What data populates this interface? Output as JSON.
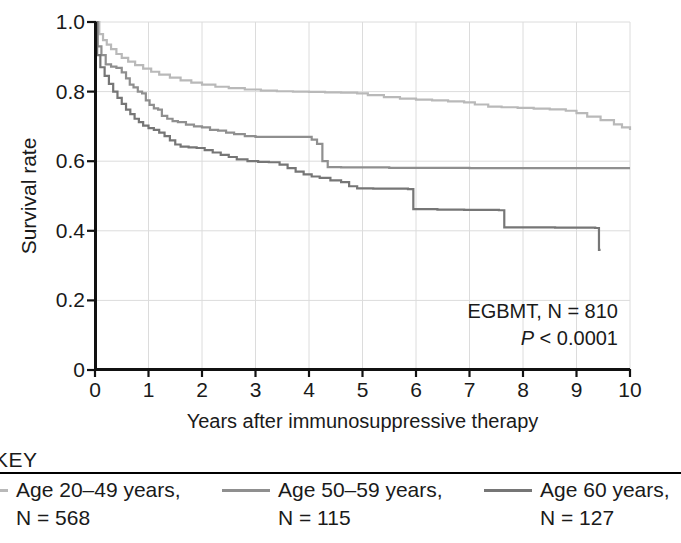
{
  "figure": {
    "y_axis_label": "Survival rate",
    "x_axis_label": "Years after immunosuppressive therapy",
    "annotation_line1": "EGBMT, N = 810",
    "annotation_p_symbol": "P",
    "annotation_p_rest": " < 0.0001",
    "key_title": "KEY"
  },
  "legend": {
    "entries": [
      {
        "label": "Age 20–49 years,",
        "n_text": "N = 568",
        "color": "#b9b9b9"
      },
      {
        "label": "Age 50–59 years,",
        "n_text": "N = 115",
        "color": "#8f8f8f"
      },
      {
        "label": "Age  60 years,",
        "n_text": "N = 127",
        "color": "#767676"
      }
    ]
  },
  "chart_data": {
    "type": "line",
    "title": "",
    "subtitle": "",
    "xlabel": "Years after immunosuppressive therapy",
    "ylabel": "Survival rate",
    "xlim": [
      0,
      10
    ],
    "ylim": [
      0,
      1.0
    ],
    "xticks": [
      0,
      1,
      2,
      3,
      4,
      5,
      6,
      7,
      8,
      9,
      10
    ],
    "xtick_labels": [
      "0",
      "1",
      "2",
      "3",
      "4",
      "5",
      "6",
      "7",
      "8",
      "9",
      "10"
    ],
    "yticks": [
      0,
      0.2,
      0.4,
      0.6,
      0.8,
      1.0
    ],
    "ytick_labels": [
      "0",
      "0.2",
      "0.4",
      "0.6",
      "0.8",
      "1.0"
    ],
    "grid": true,
    "grid_color": "#dcdcdc",
    "legend_position": "below-figure",
    "annotations": [
      {
        "text": "EGBMT, N = 810",
        "x": 9.7,
        "y": 0.21
      },
      {
        "text": "P < 0.0001",
        "x": 9.7,
        "y": 0.135
      }
    ],
    "series": [
      {
        "name": "Age 20–49 years",
        "n": 568,
        "color": "#b9b9b9",
        "step": "post",
        "points": [
          [
            0.0,
            1.0
          ],
          [
            0.08,
            0.965
          ],
          [
            0.15,
            0.948
          ],
          [
            0.22,
            0.935
          ],
          [
            0.3,
            0.922
          ],
          [
            0.4,
            0.908
          ],
          [
            0.5,
            0.897
          ],
          [
            0.62,
            0.886
          ],
          [
            0.75,
            0.876
          ],
          [
            0.9,
            0.866
          ],
          [
            1.05,
            0.857
          ],
          [
            1.2,
            0.849
          ],
          [
            1.4,
            0.84
          ],
          [
            1.6,
            0.832
          ],
          [
            1.8,
            0.826
          ],
          [
            2.0,
            0.82
          ],
          [
            2.25,
            0.814
          ],
          [
            2.5,
            0.81
          ],
          [
            2.8,
            0.806
          ],
          [
            3.1,
            0.803
          ],
          [
            3.4,
            0.801
          ],
          [
            3.7,
            0.8
          ],
          [
            4.0,
            0.799
          ],
          [
            4.3,
            0.798
          ],
          [
            4.6,
            0.797
          ],
          [
            4.9,
            0.795
          ],
          [
            5.1,
            0.79
          ],
          [
            5.4,
            0.784
          ],
          [
            5.7,
            0.78
          ],
          [
            6.0,
            0.777
          ],
          [
            6.3,
            0.775
          ],
          [
            6.6,
            0.772
          ],
          [
            6.9,
            0.769
          ],
          [
            7.1,
            0.763
          ],
          [
            7.35,
            0.757
          ],
          [
            7.6,
            0.755
          ],
          [
            7.9,
            0.753
          ],
          [
            8.2,
            0.751
          ],
          [
            8.5,
            0.749
          ],
          [
            8.8,
            0.745
          ],
          [
            9.0,
            0.738
          ],
          [
            9.2,
            0.728
          ],
          [
            9.45,
            0.718
          ],
          [
            9.7,
            0.706
          ],
          [
            9.85,
            0.697
          ],
          [
            10.0,
            0.69
          ]
        ]
      },
      {
        "name": "Age 50–59 years",
        "n": 115,
        "color": "#8f8f8f",
        "step": "post",
        "points": [
          [
            0.0,
            1.0
          ],
          [
            0.05,
            0.93
          ],
          [
            0.12,
            0.905
          ],
          [
            0.2,
            0.878
          ],
          [
            0.3,
            0.872
          ],
          [
            0.4,
            0.868
          ],
          [
            0.5,
            0.855
          ],
          [
            0.58,
            0.838
          ],
          [
            0.65,
            0.82
          ],
          [
            0.72,
            0.812
          ],
          [
            0.8,
            0.8
          ],
          [
            0.88,
            0.795
          ],
          [
            0.95,
            0.775
          ],
          [
            1.02,
            0.762
          ],
          [
            1.1,
            0.752
          ],
          [
            1.18,
            0.748
          ],
          [
            1.25,
            0.73
          ],
          [
            1.35,
            0.722
          ],
          [
            1.45,
            0.715
          ],
          [
            1.55,
            0.712
          ],
          [
            1.7,
            0.705
          ],
          [
            1.85,
            0.7
          ],
          [
            2.0,
            0.697
          ],
          [
            2.15,
            0.69
          ],
          [
            2.3,
            0.688
          ],
          [
            2.45,
            0.682
          ],
          [
            2.6,
            0.678
          ],
          [
            2.8,
            0.672
          ],
          [
            3.0,
            0.67
          ],
          [
            3.3,
            0.67
          ],
          [
            3.6,
            0.67
          ],
          [
            3.9,
            0.67
          ],
          [
            4.05,
            0.662
          ],
          [
            4.15,
            0.65
          ],
          [
            4.25,
            0.6
          ],
          [
            4.35,
            0.583
          ],
          [
            4.6,
            0.582
          ],
          [
            5.0,
            0.582
          ],
          [
            5.5,
            0.581
          ],
          [
            6.0,
            0.581
          ],
          [
            6.5,
            0.581
          ],
          [
            7.0,
            0.58
          ],
          [
            7.5,
            0.58
          ],
          [
            8.0,
            0.58
          ],
          [
            8.5,
            0.58
          ],
          [
            9.0,
            0.58
          ],
          [
            9.5,
            0.58
          ],
          [
            10.0,
            0.58
          ]
        ]
      },
      {
        "name": "Age 60 years and older",
        "n": 127,
        "color": "#767676",
        "step": "post",
        "points": [
          [
            0.0,
            1.0
          ],
          [
            0.04,
            0.905
          ],
          [
            0.1,
            0.87
          ],
          [
            0.18,
            0.845
          ],
          [
            0.26,
            0.822
          ],
          [
            0.34,
            0.8
          ],
          [
            0.42,
            0.782
          ],
          [
            0.5,
            0.765
          ],
          [
            0.58,
            0.748
          ],
          [
            0.66,
            0.735
          ],
          [
            0.74,
            0.722
          ],
          [
            0.82,
            0.712
          ],
          [
            0.9,
            0.702
          ],
          [
            1.0,
            0.695
          ],
          [
            1.1,
            0.69
          ],
          [
            1.2,
            0.682
          ],
          [
            1.3,
            0.672
          ],
          [
            1.4,
            0.66
          ],
          [
            1.5,
            0.648
          ],
          [
            1.6,
            0.642
          ],
          [
            1.75,
            0.64
          ],
          [
            1.9,
            0.638
          ],
          [
            2.05,
            0.632
          ],
          [
            2.2,
            0.625
          ],
          [
            2.35,
            0.618
          ],
          [
            2.5,
            0.612
          ],
          [
            2.65,
            0.605
          ],
          [
            2.85,
            0.6
          ],
          [
            3.05,
            0.598
          ],
          [
            3.25,
            0.597
          ],
          [
            3.45,
            0.59
          ],
          [
            3.6,
            0.58
          ],
          [
            3.75,
            0.57
          ],
          [
            3.9,
            0.562
          ],
          [
            4.05,
            0.556
          ],
          [
            4.2,
            0.552
          ],
          [
            4.4,
            0.545
          ],
          [
            4.6,
            0.54
          ],
          [
            4.75,
            0.528
          ],
          [
            4.9,
            0.522
          ],
          [
            5.2,
            0.521
          ],
          [
            5.6,
            0.521
          ],
          [
            5.85,
            0.52
          ],
          [
            5.95,
            0.462
          ],
          [
            6.4,
            0.461
          ],
          [
            6.9,
            0.46
          ],
          [
            7.3,
            0.46
          ],
          [
            7.55,
            0.459
          ],
          [
            7.65,
            0.41
          ],
          [
            8.1,
            0.41
          ],
          [
            8.6,
            0.409
          ],
          [
            9.1,
            0.409
          ],
          [
            9.35,
            0.408
          ],
          [
            9.42,
            0.345
          ],
          [
            9.45,
            0.345
          ]
        ]
      }
    ]
  }
}
